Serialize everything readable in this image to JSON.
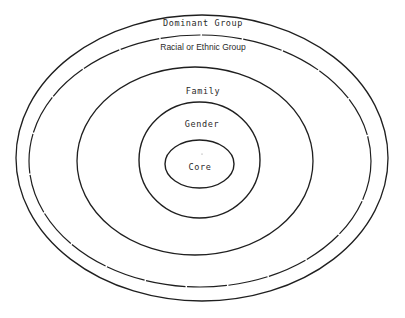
{
  "diagram": {
    "type": "concentric-ellipses",
    "layers": [
      {
        "id": "dominant",
        "label": "Dominant Group"
      },
      {
        "id": "racial",
        "label": "Racial or Ethnic Group"
      },
      {
        "id": "family",
        "label": "Family"
      },
      {
        "id": "gender",
        "label": "Gender"
      },
      {
        "id": "core",
        "label": "Core"
      }
    ],
    "stroke_color": "#1f1f1f",
    "background": "#ffffff"
  }
}
